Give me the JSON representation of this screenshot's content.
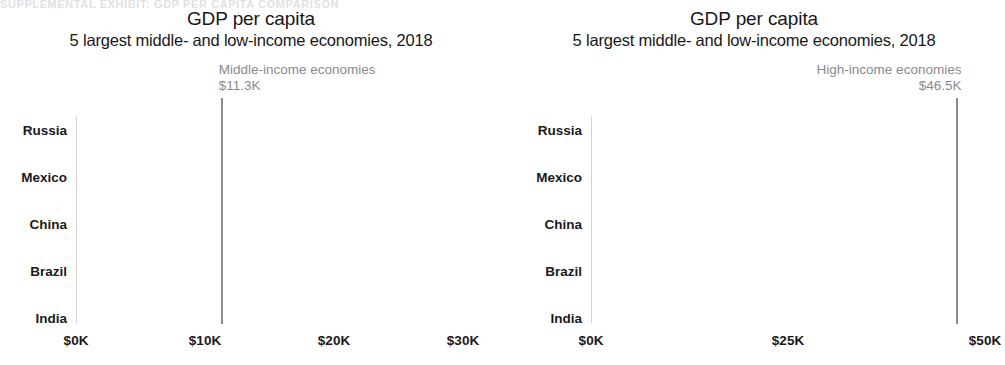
{
  "top_crop_text": "SUPPLEMENTAL EXHIBIT: GDP PER CAPITA COMPARISON",
  "colors": {
    "bar": "#231f20",
    "reference_line": "#8c8c92",
    "annotation_text": "#8a8a90",
    "axis_text": "#1a1a1a",
    "background": "#ffffff"
  },
  "panels": [
    {
      "id": "left",
      "title": "GDP per capita",
      "subtitle": "5 largest middle- and low-income economies, 2018",
      "reference": {
        "label": "Middle-income economies",
        "value_label": "$11.3K",
        "value": 11.3,
        "align": "left"
      },
      "axis": {
        "ticks": [
          "$0K",
          "$10K",
          "$20K",
          "$30K"
        ],
        "tick_values": [
          0,
          10,
          20,
          30
        ],
        "min": 0,
        "max": 30
      },
      "bars": [
        {
          "label": "Russia",
          "value": 26.0
        },
        {
          "label": "Mexico",
          "value": 18.6
        },
        {
          "label": "China",
          "value": 17.2
        },
        {
          "label": "Brazil",
          "value": 15.8
        },
        {
          "label": "India",
          "value": 6.7
        }
      ]
    },
    {
      "id": "right",
      "title": "GDP per capita",
      "subtitle": "5 largest middle- and low-income economies, 2018",
      "reference": {
        "label": "High-income economies",
        "value_label": "$46.5K",
        "value": 46.5,
        "align": "right"
      },
      "axis": {
        "ticks": [
          "$0K",
          "$25K",
          "$50K"
        ],
        "tick_values": [
          0,
          25,
          50
        ],
        "min": 0,
        "max": 50
      },
      "bars": [
        {
          "label": "Russia",
          "value": 26.0
        },
        {
          "label": "Mexico",
          "value": 18.6
        },
        {
          "label": "China",
          "value": 17.2
        },
        {
          "label": "Brazil",
          "value": 15.8
        },
        {
          "label": "India",
          "value": 6.7
        }
      ]
    }
  ],
  "chart_data": [
    {
      "type": "bar",
      "orientation": "horizontal",
      "title": "GDP per capita",
      "subtitle": "5 largest middle- and low-income economies, 2018",
      "categories": [
        "Russia",
        "Mexico",
        "China",
        "Brazil",
        "India"
      ],
      "values": [
        26.0,
        18.6,
        17.2,
        15.8,
        6.7
      ],
      "unit": "thousands of USD",
      "xlabel": "",
      "ylabel": "",
      "xlim": [
        0,
        30
      ],
      "xticks": [
        0,
        10,
        20,
        30
      ],
      "xticklabels": [
        "$0K",
        "$10K",
        "$20K",
        "$30K"
      ],
      "grid": false,
      "legend": "none",
      "annotations": [
        {
          "type": "vertical-reference-line",
          "value": 11.3,
          "label": "Middle-income economies",
          "value_label": "$11.3K"
        }
      ]
    },
    {
      "type": "bar",
      "orientation": "horizontal",
      "title": "GDP per capita",
      "subtitle": "5 largest middle- and low-income economies, 2018",
      "categories": [
        "Russia",
        "Mexico",
        "China",
        "Brazil",
        "India"
      ],
      "values": [
        26.0,
        18.6,
        17.2,
        15.8,
        6.7
      ],
      "unit": "thousands of USD",
      "xlabel": "",
      "ylabel": "",
      "xlim": [
        0,
        50
      ],
      "xticks": [
        0,
        25,
        50
      ],
      "xticklabels": [
        "$0K",
        "$25K",
        "$50K"
      ],
      "grid": false,
      "legend": "none",
      "annotations": [
        {
          "type": "vertical-reference-line",
          "value": 46.5,
          "label": "High-income economies",
          "value_label": "$46.5K"
        }
      ]
    }
  ]
}
